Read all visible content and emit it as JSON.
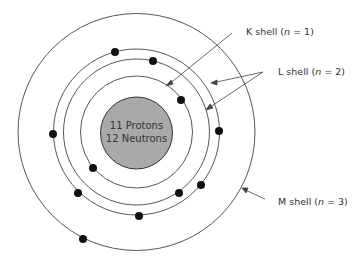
{
  "nucleus": {
    "line1": "11 Protons",
    "line2": "12 Neutrons",
    "color": "#a9a9a9"
  },
  "labels": {
    "k_shell": {
      "prefix": "K shell (",
      "n": "n",
      "suffix": " = 1)"
    },
    "l_shell": {
      "prefix": "L shell (",
      "n": "n",
      "suffix": " = 2)"
    },
    "m_shell": {
      "prefix": "M shell (",
      "n": "n",
      "suffix": " = 3)"
    }
  },
  "electrons": {
    "k_shell": 2,
    "l_shell": 8,
    "m_shell": 1,
    "total": 11
  }
}
